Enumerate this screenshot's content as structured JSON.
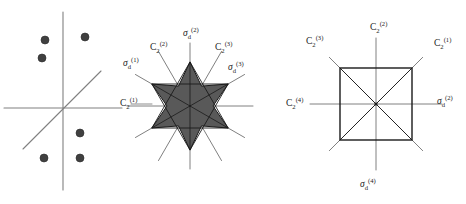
{
  "figure": {
    "type": "diagram",
    "background_color": "#ffffff",
    "line_color": "#808080",
    "shape_outline_color": "#1a1a1a",
    "star_fill_color": "#595959",
    "dot_color": "#404040",
    "label_color": "#1a1a1a"
  },
  "panels": [
    {
      "id": "panel-points",
      "name": "scattered-points-panel",
      "center": {
        "x": 63,
        "y": 108
      },
      "axes": [
        {
          "name": "vertical-axis",
          "x1": 63,
          "y1": 12,
          "x2": 63,
          "y2": 190
        },
        {
          "name": "horizontal-axis",
          "x1": 4,
          "y1": 108,
          "x2": 122,
          "y2": 108
        },
        {
          "name": "diagonal-axis",
          "x1": 23,
          "y1": 149,
          "x2": 101,
          "y2": 71
        }
      ],
      "points": [
        {
          "label": "p1",
          "x": 45,
          "y": 40,
          "r": 4
        },
        {
          "label": "p2",
          "x": 85,
          "y": 37,
          "r": 4
        },
        {
          "label": "p3",
          "x": 42,
          "y": 58,
          "r": 4
        },
        {
          "label": "p4",
          "x": 80,
          "y": 133,
          "r": 4
        },
        {
          "label": "p5",
          "x": 44,
          "y": 158,
          "r": 4
        },
        {
          "label": "p6",
          "x": 80,
          "y": 158,
          "r": 4
        }
      ]
    },
    {
      "id": "panel-hexagram",
      "name": "hexagram-panel",
      "center": {
        "x": 190,
        "y": 106
      },
      "outer_radius": 44,
      "inner_radius": 23,
      "line_length": 63,
      "axis_angles_deg": [
        0,
        30,
        60,
        90,
        120,
        150
      ],
      "labels": [
        {
          "key": "sigma_d_1",
          "base": "σ",
          "sub": "d",
          "sup": "(1)",
          "x": 123,
          "y": 66,
          "anchor": "start"
        },
        {
          "key": "C2_2",
          "base": "C",
          "sub": "2",
          "sup": "(2)",
          "x": 150,
          "y": 50,
          "anchor": "start"
        },
        {
          "key": "sigma_d_2",
          "base": "σ",
          "sub": "d",
          "sup": "(2)",
          "x": 183,
          "y": 36,
          "anchor": "start"
        },
        {
          "key": "C2_3",
          "base": "C",
          "sub": "2",
          "sup": "(3)",
          "x": 215,
          "y": 50,
          "anchor": "start"
        },
        {
          "key": "sigma_d_3",
          "base": "σ",
          "sub": "d",
          "sup": "(3)",
          "x": 228,
          "y": 70,
          "anchor": "start"
        },
        {
          "key": "C2_1",
          "base": "C",
          "sub": "2",
          "sup": "(1)",
          "x": 120,
          "y": 106,
          "anchor": "start"
        }
      ]
    },
    {
      "id": "panel-square",
      "name": "square-panel",
      "center": {
        "x": 376,
        "y": 104
      },
      "square": {
        "x": 340,
        "y": 68,
        "width": 72,
        "height": 72
      },
      "line_half_length": 66,
      "axis_angles_deg": [
        0,
        45,
        90,
        135
      ],
      "labels": [
        {
          "key": "C2_3",
          "base": "C",
          "sub": "2",
          "sup": "(3)",
          "x": 306,
          "y": 44,
          "anchor": "start"
        },
        {
          "key": "C2_2",
          "base": "C",
          "sub": "2",
          "sup": "(2)",
          "x": 370,
          "y": 30,
          "anchor": "start"
        },
        {
          "key": "C2_1",
          "base": "C",
          "sub": "2",
          "sup": "(1)",
          "x": 434,
          "y": 46,
          "anchor": "start"
        },
        {
          "key": "C2_4",
          "base": "C",
          "sub": "2",
          "sup": "(4)",
          "x": 286,
          "y": 106,
          "anchor": "start"
        },
        {
          "key": "sigma_d_2",
          "base": "σ",
          "sub": "d",
          "sup": "(2)",
          "x": 437,
          "y": 104,
          "anchor": "start"
        },
        {
          "key": "sigma_d_4",
          "base": "σ",
          "sub": "d",
          "sup": "(4)",
          "x": 360,
          "y": 187,
          "anchor": "start"
        }
      ]
    }
  ]
}
